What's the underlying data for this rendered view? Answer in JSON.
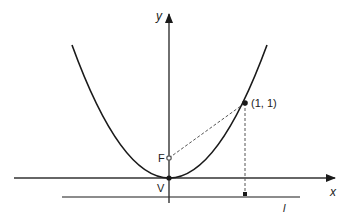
{
  "diagram": {
    "labels": {
      "y_axis": "y",
      "x_axis": "x",
      "focus": "F",
      "vertex": "V",
      "point": "(1, 1)",
      "directrix": "l"
    },
    "geometry": {
      "origin_px": [
        169,
        178
      ],
      "unit_px": 76,
      "parabola": "y = x^2",
      "focus": [
        0,
        0.25
      ],
      "vertex": [
        0,
        0
      ],
      "point": [
        1,
        1
      ],
      "directrix": "y = -0.25"
    },
    "colors": {
      "stroke": "#1a1a1a",
      "dashed": "#555555",
      "directrix": "#666666"
    }
  }
}
